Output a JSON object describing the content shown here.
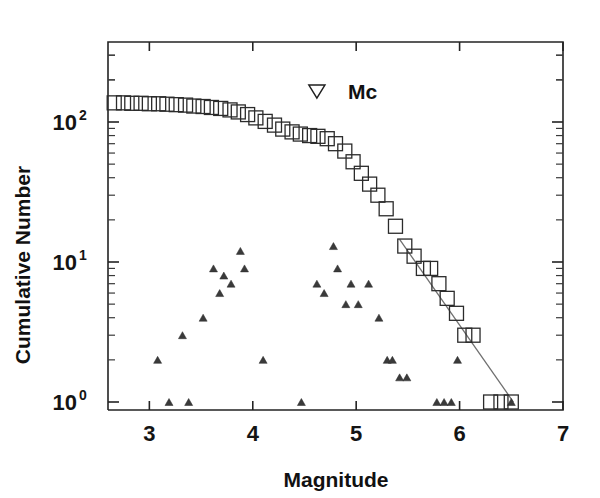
{
  "chart_data": {
    "type": "scatter",
    "title": "",
    "subtitle": "",
    "xlabel": "Magnitude",
    "ylabel": "Cumulative Number",
    "xlim": [
      2.6,
      7.0
    ],
    "ylim": [
      1,
      300
    ],
    "yscale": "log",
    "xscale": "linear",
    "grid": false,
    "legend_position": "none",
    "x_ticks": [
      {
        "value": 3,
        "label": "3"
      },
      {
        "value": 4,
        "label": "4"
      },
      {
        "value": 5,
        "label": "5"
      },
      {
        "value": 6,
        "label": "6"
      },
      {
        "value": 7,
        "label": "7"
      }
    ],
    "y_ticks": [
      {
        "value": 1,
        "mantissa": "10",
        "exponent": "0"
      },
      {
        "value": 10,
        "mantissa": "10",
        "exponent": "1"
      },
      {
        "value": 100,
        "mantissa": "10",
        "exponent": "2"
      }
    ],
    "annotations": [
      {
        "name": "mc-annotation",
        "label": "Mc",
        "marker": "down-triangle-open",
        "x": 4.62,
        "y": 165,
        "label_x": 4.92,
        "label_y": 165
      }
    ],
    "series": [
      {
        "name": "Cumulative number",
        "marker": "square-open",
        "points": [
          {
            "x": 2.66,
            "y": 137
          },
          {
            "x": 2.75,
            "y": 137
          },
          {
            "x": 2.83,
            "y": 136
          },
          {
            "x": 2.92,
            "y": 136
          },
          {
            "x": 3.0,
            "y": 135
          },
          {
            "x": 3.09,
            "y": 135
          },
          {
            "x": 3.17,
            "y": 134
          },
          {
            "x": 3.26,
            "y": 133
          },
          {
            "x": 3.35,
            "y": 132
          },
          {
            "x": 3.43,
            "y": 130
          },
          {
            "x": 3.52,
            "y": 129
          },
          {
            "x": 3.6,
            "y": 127
          },
          {
            "x": 3.69,
            "y": 125
          },
          {
            "x": 3.78,
            "y": 122
          },
          {
            "x": 3.86,
            "y": 118
          },
          {
            "x": 3.95,
            "y": 113
          },
          {
            "x": 4.03,
            "y": 107
          },
          {
            "x": 4.12,
            "y": 101
          },
          {
            "x": 4.21,
            "y": 95
          },
          {
            "x": 4.29,
            "y": 89
          },
          {
            "x": 4.38,
            "y": 85
          },
          {
            "x": 4.46,
            "y": 82
          },
          {
            "x": 4.55,
            "y": 80
          },
          {
            "x": 4.63,
            "y": 79
          },
          {
            "x": 4.72,
            "y": 76
          },
          {
            "x": 4.8,
            "y": 70
          },
          {
            "x": 4.89,
            "y": 62
          },
          {
            "x": 4.97,
            "y": 52
          },
          {
            "x": 5.05,
            "y": 43
          },
          {
            "x": 5.13,
            "y": 36
          },
          {
            "x": 5.21,
            "y": 30
          },
          {
            "x": 5.29,
            "y": 24
          },
          {
            "x": 5.38,
            "y": 18
          },
          {
            "x": 5.47,
            "y": 13
          },
          {
            "x": 5.56,
            "y": 11
          },
          {
            "x": 5.65,
            "y": 9
          },
          {
            "x": 5.72,
            "y": 9
          },
          {
            "x": 5.8,
            "y": 7
          },
          {
            "x": 5.88,
            "y": 5.5
          },
          {
            "x": 5.97,
            "y": 4.3
          },
          {
            "x": 6.05,
            "y": 3
          },
          {
            "x": 6.13,
            "y": 3
          },
          {
            "x": 6.3,
            "y": 1
          },
          {
            "x": 6.4,
            "y": 1
          },
          {
            "x": 6.5,
            "y": 1
          }
        ]
      },
      {
        "name": "Incremental number",
        "marker": "triangle-filled",
        "points": [
          {
            "x": 3.08,
            "y": 2
          },
          {
            "x": 3.19,
            "y": 1
          },
          {
            "x": 3.32,
            "y": 3
          },
          {
            "x": 3.38,
            "y": 1
          },
          {
            "x": 3.52,
            "y": 4
          },
          {
            "x": 3.62,
            "y": 9
          },
          {
            "x": 3.68,
            "y": 6
          },
          {
            "x": 3.72,
            "y": 8
          },
          {
            "x": 3.79,
            "y": 7
          },
          {
            "x": 3.88,
            "y": 12
          },
          {
            "x": 3.92,
            "y": 9
          },
          {
            "x": 4.1,
            "y": 2
          },
          {
            "x": 4.47,
            "y": 1
          },
          {
            "x": 4.62,
            "y": 7
          },
          {
            "x": 4.69,
            "y": 6
          },
          {
            "x": 4.78,
            "y": 13
          },
          {
            "x": 4.82,
            "y": 9
          },
          {
            "x": 4.9,
            "y": 5
          },
          {
            "x": 4.95,
            "y": 7
          },
          {
            "x": 5.02,
            "y": 5
          },
          {
            "x": 5.12,
            "y": 7
          },
          {
            "x": 5.22,
            "y": 4
          },
          {
            "x": 5.3,
            "y": 2
          },
          {
            "x": 5.35,
            "y": 2
          },
          {
            "x": 5.42,
            "y": 1.5
          },
          {
            "x": 5.49,
            "y": 1.5
          },
          {
            "x": 5.78,
            "y": 1
          },
          {
            "x": 5.85,
            "y": 1
          },
          {
            "x": 5.92,
            "y": 1
          },
          {
            "x": 5.98,
            "y": 2
          },
          {
            "x": 6.5,
            "y": 1
          }
        ]
      }
    ],
    "fit_line": {
      "name": "Gutenberg-Richter fit",
      "x_start": 5.42,
      "y_start": 14.5,
      "x_end": 6.52,
      "y_end": 1.0,
      "color": "#6f6f6f"
    }
  },
  "colors": {
    "axis": "#232323",
    "marker": "#2b2b2b",
    "fit": "#6f6f6f",
    "background": "#ffffff"
  }
}
